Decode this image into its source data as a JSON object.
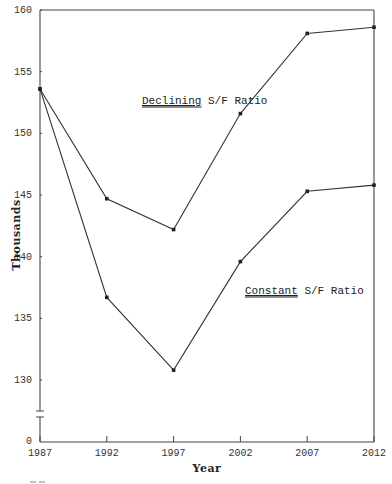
{
  "chart_data": {
    "type": "line",
    "title": "",
    "xlabel": "Year",
    "ylabel": "Thousands",
    "x": [
      1987,
      1992,
      1997,
      2002,
      2007,
      2012
    ],
    "x_tick_labels": [
      "1987",
      "1992",
      "1997",
      "2002",
      "2007",
      "2012"
    ],
    "y_tick_labels": [
      "0",
      "130",
      "135",
      "140",
      "145",
      "150",
      "155",
      "160"
    ],
    "y_ticks": [
      130,
      135,
      140,
      145,
      150,
      155,
      160
    ],
    "ylim": [
      130,
      160
    ],
    "y_axis_break": true,
    "y_axis_break_note": "Axis broken between 0 and ~128",
    "grid": false,
    "legend_position": "inline annotations",
    "series": [
      {
        "name": "Declining S/F Ratio",
        "label_underlined_word": "Declining",
        "label_rest": " S/F Ratio",
        "values": [
          153.6,
          144.7,
          142.2,
          151.6,
          158.1,
          158.6
        ]
      },
      {
        "name": "Constant S/F Ratio",
        "label_underlined_word": "Constant",
        "label_rest": " S/F Ratio",
        "values": [
          153.6,
          136.7,
          130.8,
          139.6,
          145.3,
          145.8
        ]
      }
    ]
  }
}
